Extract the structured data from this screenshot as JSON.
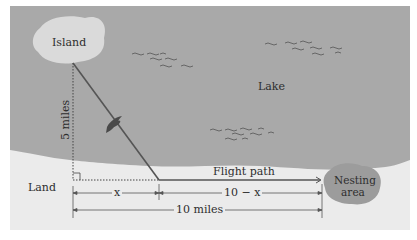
{
  "diagram": {
    "labels": {
      "island": "Island",
      "lake": "Lake",
      "land": "Land",
      "nesting_area_line1": "Nesting",
      "nesting_area_line2": "area",
      "vertical_distance": "5 miles",
      "flight_path": "Flight path",
      "segment_x": "x",
      "segment_remainder": "10 − x",
      "total_distance": "10 miles"
    },
    "colors": {
      "lake": "#a9a9a9",
      "land": "#ebebeb",
      "island": "#dadada",
      "nesting_area": "#9c9c9c",
      "lines": "#555555",
      "bird": "#4a4a4a"
    }
  }
}
